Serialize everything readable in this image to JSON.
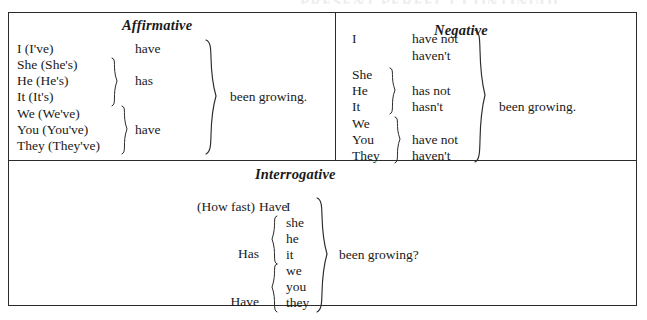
{
  "page": {
    "cutoff_text": "PRESENT PERFECT CONTINUOUS",
    "background_color": "#ffffff",
    "rule_color": "#2b2b2b"
  },
  "table": {
    "panels": [
      {
        "id": "affirmative",
        "heading": "Affirmative",
        "subject_column": [
          "I (I've)",
          "She (She's)",
          "He (He's)",
          "It (It's)",
          "We (We've)",
          "You (You've)",
          "They (They've)"
        ],
        "auxiliary_column": [
          "have",
          "has",
          "have"
        ],
        "predicate": "been growing.",
        "braces": [
          {
            "name": "brace-has-group",
            "groups": [
              "She (She's)",
              "He (He's)",
              "It (It's)"
            ]
          },
          {
            "name": "brace-have-group",
            "groups": [
              "We (We've)",
              "You (You've)",
              "They (They've)"
            ]
          },
          {
            "name": "brace-predicate",
            "groups": [
              "all subjects"
            ]
          }
        ]
      },
      {
        "id": "negative",
        "heading": "Negative",
        "subject_column": [
          "I",
          "She",
          "He",
          "It",
          "We",
          "You",
          "They"
        ],
        "auxiliary_column": [
          "have not",
          "haven't",
          "has not",
          "hasn't",
          "have not",
          "haven't"
        ],
        "predicate": "been growing.",
        "braces": [
          {
            "name": "brace-she-he-it",
            "groups": [
              "She",
              "He",
              "It"
            ]
          },
          {
            "name": "brace-we-you-they",
            "groups": [
              "We",
              "You",
              "They"
            ]
          },
          {
            "name": "brace-predicate",
            "groups": [
              "all subjects"
            ]
          }
        ]
      },
      {
        "id": "interrogative",
        "heading": "Interrogative",
        "adverbial": "(How fast)",
        "auxiliary_column": [
          "Have",
          "Has",
          "Have"
        ],
        "subject_column": [
          "I",
          "she",
          "he",
          "it",
          "we",
          "you",
          "they"
        ],
        "predicate": "been growing?",
        "braces": [
          {
            "name": "brace-has-subjects",
            "groups": [
              "she",
              "he",
              "it"
            ]
          },
          {
            "name": "brace-have-subjects",
            "groups": [
              "we",
              "you",
              "they"
            ]
          },
          {
            "name": "brace-predicate",
            "groups": [
              "all subjects"
            ]
          }
        ]
      }
    ]
  }
}
